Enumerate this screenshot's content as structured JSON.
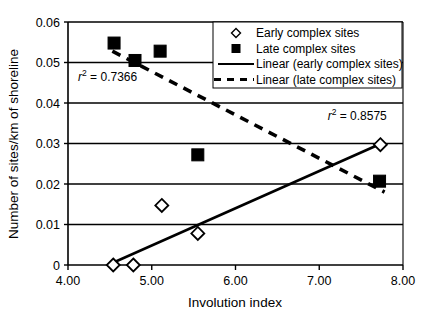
{
  "chart_data": {
    "type": "scatter",
    "title": "",
    "xlabel": "Involution index",
    "ylabel": "Number of sites/km of shoreline",
    "xlim": [
      4.0,
      8.0
    ],
    "ylim": [
      0,
      0.06
    ],
    "xticks": [
      "4.00",
      "5.00",
      "6.00",
      "7.00",
      "8.00"
    ],
    "xtick_values": [
      4.0,
      5.0,
      6.0,
      7.0,
      8.0
    ],
    "yticks": [
      "0",
      "0.01",
      "0.02",
      "0.03",
      "0.04",
      "0.05",
      "0.06"
    ],
    "ytick_values": [
      0,
      0.01,
      0.02,
      0.03,
      0.04,
      0.05,
      0.06
    ],
    "grid": "horizontal",
    "legend_position": "top-right",
    "series": [
      {
        "name": "Early complex sites",
        "marker": "open-diamond",
        "points": [
          {
            "x": 4.54,
            "y": 0.0
          },
          {
            "x": 4.78,
            "y": 0.0
          },
          {
            "x": 5.12,
            "y": 0.0147
          },
          {
            "x": 5.55,
            "y": 0.0078
          },
          {
            "x": 7.73,
            "y": 0.0297
          }
        ]
      },
      {
        "name": "Late complex sites",
        "marker": "filled-square",
        "points": [
          {
            "x": 4.55,
            "y": 0.0548
          },
          {
            "x": 4.8,
            "y": 0.0505
          },
          {
            "x": 5.1,
            "y": 0.0528
          },
          {
            "x": 5.55,
            "y": 0.0272
          },
          {
            "x": 7.72,
            "y": 0.0207
          }
        ]
      }
    ],
    "trendlines": [
      {
        "name": "Linear (early complex sites)",
        "style": "solid",
        "x_start": 4.53,
        "y_start": 0.0005,
        "x_end": 7.74,
        "y_end": 0.03,
        "r_squared": "0.8575",
        "r2_label": "r2 = 0.8575"
      },
      {
        "name": "Linear (late complex sites)",
        "style": "dashed",
        "x_start": 4.53,
        "y_start": 0.0528,
        "x_end": 7.78,
        "y_end": 0.018,
        "r_squared": "0.7366",
        "r2_label": "r2 = 0.7366"
      }
    ],
    "annotations": [
      {
        "text_r": "r",
        "text_sup": "2",
        "text_rest": " = 0.7366",
        "x": 4.12,
        "y": 0.0455
      },
      {
        "text_r": "r",
        "text_sup": "2",
        "text_rest": " = 0.8575",
        "x": 7.1,
        "y": 0.0358
      }
    ],
    "legend_entries": [
      {
        "label": "Early complex sites",
        "symbol": "open-diamond"
      },
      {
        "label": "Late complex sites",
        "symbol": "filled-square"
      },
      {
        "label": "Linear (early complex sites)",
        "symbol": "solid-line"
      },
      {
        "label": "Linear (late complex sites)",
        "symbol": "dashed-line"
      }
    ],
    "colors": {
      "axis": "#000000",
      "grid": "#000000",
      "marker": "#000000",
      "background": "#ffffff"
    }
  }
}
